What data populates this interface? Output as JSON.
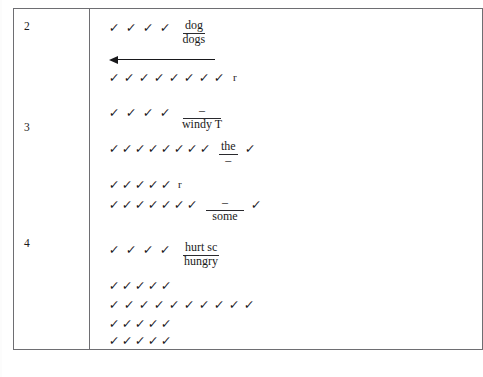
{
  "document": {
    "type": "handwriting-scoring-table",
    "glyphs": {
      "check": "✓",
      "dash": "–"
    },
    "colors": {
      "border": "#6e6e72",
      "ink": "#18181b",
      "paper": "#ffffff"
    }
  },
  "table": {
    "rows": [
      {
        "number": "2",
        "lines": [
          {
            "id": "r2-l1",
            "checks_before": 4,
            "annotation": {
              "word": "dog",
              "underlined": true,
              "below": "dogs"
            },
            "checks_after": 0,
            "trailing": ""
          },
          {
            "id": "r2-arrow",
            "kind": "arrow",
            "direction": "left",
            "label": "left-pointing-arrow"
          },
          {
            "id": "r2-l2",
            "checks_before": 8,
            "annotation": null,
            "checks_after": 0,
            "trailing": "r"
          }
        ]
      },
      {
        "number": "3",
        "lines": [
          {
            "id": "r3-l1",
            "checks_before": 4,
            "annotation": {
              "word": "–",
              "underlined": true,
              "below": "windy T",
              "blank": true
            },
            "checks_after": 0,
            "trailing": ""
          },
          {
            "id": "r3-l2",
            "checks_before": 8,
            "annotation": {
              "word": "the",
              "underlined": true,
              "below": "–"
            },
            "checks_after": 1,
            "trailing": ""
          },
          {
            "id": "r3-l3",
            "checks_before": 5,
            "annotation": null,
            "checks_after": 0,
            "trailing": "r"
          },
          {
            "id": "r3-l4",
            "checks_before": 7,
            "annotation": {
              "word": "–",
              "underlined": true,
              "below": "some",
              "blank": true
            },
            "checks_after": 1,
            "trailing": ""
          }
        ]
      },
      {
        "number": "4",
        "lines": [
          {
            "id": "r4-l1",
            "checks_before": 4,
            "annotation": {
              "word": "hurt sc",
              "underlined": true,
              "below": "hungry"
            },
            "checks_after": 0,
            "trailing": ""
          },
          {
            "id": "r4-l2",
            "checks_before": 5,
            "annotation": null,
            "checks_after": 0,
            "trailing": ""
          },
          {
            "id": "r4-l3",
            "checks_before": 10,
            "annotation": null,
            "checks_after": 0,
            "trailing": ""
          },
          {
            "id": "r4-l4",
            "checks_before": 5,
            "annotation": null,
            "checks_after": 0,
            "trailing": ""
          },
          {
            "id": "r4-l5",
            "checks_before": 5,
            "annotation": null,
            "checks_after": 0,
            "trailing": ""
          }
        ]
      }
    ]
  },
  "labels": {
    "row_number_2": "2",
    "row_number_3": "3",
    "row_number_4": "4",
    "word_dog": "dog",
    "word_dogs": "dogs",
    "word_windy_t": "windy T",
    "word_the": "the",
    "word_some": "some",
    "word_hurt_sc": "hurt sc",
    "word_hungry": "hungry",
    "letter_r_1": "r",
    "letter_r_2": "r",
    "blank_dash": "–"
  }
}
